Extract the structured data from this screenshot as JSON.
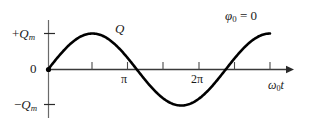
{
  "chart_data": {
    "type": "line",
    "title": "",
    "subtitle": "",
    "xlabel": "ω₀t",
    "ylabel": "Q",
    "annotation": "φ₀ = 0",
    "curve_label": "Q",
    "function": "Q = Q_m sin(ω₀t)",
    "xlim": [
      0,
      7.85
    ],
    "ylim": [
      -1,
      1
    ],
    "grid": false,
    "legend": "none",
    "x": [
      0,
      0.393,
      0.785,
      1.178,
      1.571,
      1.963,
      2.356,
      2.749,
      3.142,
      3.534,
      3.927,
      4.32,
      4.712,
      5.105,
      5.498,
      5.891,
      6.283,
      6.676,
      7.069,
      7.461,
      7.854
    ],
    "values": [
      0,
      0.383,
      0.707,
      0.924,
      1.0,
      0.924,
      0.707,
      0.383,
      0,
      -0.383,
      -0.707,
      -0.924,
      -1.0,
      -0.924,
      -0.707,
      -0.383,
      0,
      0.383,
      0.707,
      0.924,
      1.0
    ],
    "x_ticks": [
      {
        "value": 1.571,
        "label": ""
      },
      {
        "value": 3.142,
        "label": "π"
      },
      {
        "value": 4.712,
        "label": ""
      },
      {
        "value": 6.283,
        "label": "2π"
      },
      {
        "value": 7.854,
        "label": ""
      }
    ],
    "y_ticks": [
      {
        "value": 1,
        "label": "+Qₘ"
      },
      {
        "value": 0,
        "label": "0"
      },
      {
        "value": -1,
        "label": "−Qₘ"
      }
    ],
    "colors": {
      "curve": "#000000",
      "axis": "#3a3a3a",
      "text": "#1a1a1a",
      "background": "#ffffff"
    }
  },
  "labels": {
    "y_max": {
      "prefix": "+",
      "symbol": "Q",
      "subscript": "m"
    },
    "y_min": {
      "prefix": "−",
      "symbol": "Q",
      "subscript": "m"
    },
    "origin": "0",
    "tick_pi": "π",
    "tick_two_pi": "2π",
    "x_axis": {
      "symbol": "ω",
      "subscript": "0",
      "suffix": "t"
    },
    "curve": "Q",
    "phase": {
      "symbol": "φ",
      "subscript": "0",
      "equals": "= 0"
    }
  }
}
